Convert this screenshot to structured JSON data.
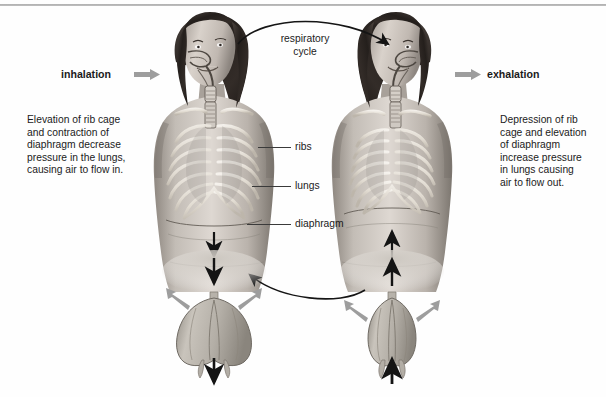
{
  "diagram": {
    "title_hidden": "",
    "cycle_label": "respiratory\ncycle",
    "cycle_label_line1": "respiratory",
    "cycle_label_line2": "cycle",
    "left": {
      "phase_label": "inhalation",
      "description": "Elevation of rib cage and contraction of diaphragm decrease pressure in the lungs, causing air to flow in.",
      "description_lines": [
        "Elevation of rib cage",
        "and contraction of",
        "diaphragm decrease",
        "pressure in the lungs,",
        "causing air to flow in."
      ],
      "arrow_direction": "right",
      "model_airflow": "in",
      "model_side_arrows": "outward",
      "model_bottom_arrow": "down"
    },
    "right": {
      "phase_label": "exhalation",
      "description": "Depression of rib cage and elevation of diaphragm increase pressure in lungs causing air to flow out.",
      "description_lines": [
        "Depression of rib",
        "cage and elevation",
        "of diaphragm",
        "increase pressure",
        "in lungs causing",
        "air to flow out."
      ],
      "arrow_direction": "right",
      "model_airflow": "out",
      "model_side_arrows": "inward",
      "model_bottom_arrow": "up"
    },
    "anatomy_labels": [
      {
        "name": "ribs",
        "text": "ribs"
      },
      {
        "name": "lungs",
        "text": "lungs"
      },
      {
        "name": "diaphragm",
        "text": "diaphragm"
      }
    ],
    "colors": {
      "text": "#1b1b1b",
      "arrow_gray": "#9a9a9a",
      "arrow_black": "#141414",
      "leader_line": "#3a3a3a",
      "background": "#fefefe",
      "top_rule": "#a9a9a9",
      "skin_light": "#dcd6d0",
      "skin_mid": "#b9b2ab",
      "skin_dark": "#6e6862",
      "hair_dark": "#241f1d",
      "bone": "#efeae2",
      "lung_model": "#b9b4ac"
    }
  }
}
